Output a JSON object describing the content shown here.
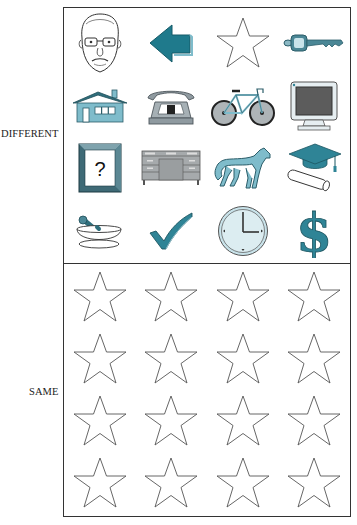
{
  "labels": {
    "different": "DIFFERENT",
    "same": "SAME"
  },
  "colors": {
    "teal": "#2f8496",
    "teal_light": "#7fbccb",
    "teal_pale": "#c9e3ea",
    "gray": "#8f9aa0",
    "outline": "#333333"
  },
  "different_panel": {
    "icons": [
      "face-icon",
      "left-arrow-icon",
      "star-icon",
      "key-icon",
      "house-icon",
      "telephone-icon",
      "bicycle-icon",
      "monitor-icon",
      "question-frame-icon",
      "desk-icon",
      "horse-icon",
      "graduation-cap-icon",
      "mortar-pestle-icon",
      "checkmark-icon",
      "clock-icon",
      "dollar-icon"
    ],
    "question_mark": "?",
    "dollar_sign": "$"
  },
  "same_panel": {
    "icons": [
      "star-icon",
      "star-icon",
      "star-icon",
      "star-icon",
      "star-icon",
      "star-icon",
      "star-icon",
      "star-icon",
      "star-icon",
      "star-icon",
      "star-icon",
      "star-icon",
      "star-icon",
      "star-icon",
      "star-icon",
      "star-icon"
    ]
  }
}
